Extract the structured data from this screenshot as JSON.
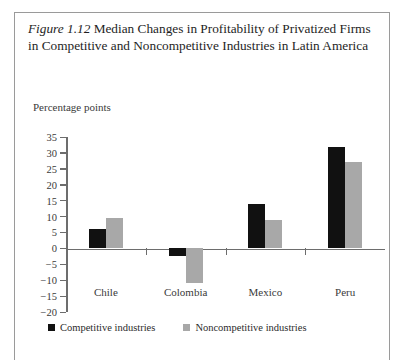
{
  "figure": {
    "label": "Figure 1.12",
    "caption": "Median Changes in Profitability of Privatized Firms in Competitive and Noncompetitive Industries in Latin America"
  },
  "axis_title": "Percentage points",
  "legend": {
    "series1_label": "Competitive industries",
    "series2_label": "Noncompetitive industries",
    "series1_color": "#111111",
    "series2_color": "#a8a8a8"
  },
  "ticks": [
    "35",
    "30",
    "25",
    "20",
    "15",
    "10",
    "5",
    "0",
    "−5",
    "−10",
    "−15",
    "−20"
  ],
  "chart_data": {
    "type": "bar",
    "title": "Figure 1.12 Median Changes in Profitability of Privatized Firms in Competitive and Noncompetitive Industries in Latin America",
    "xlabel": "",
    "ylabel": "Percentage points",
    "ylim": [
      -20,
      35
    ],
    "ytick_step": 5,
    "grid": false,
    "legend_position": "bottom-left",
    "categories": [
      "Chile",
      "Colombia",
      "Mexico",
      "Peru"
    ],
    "series": [
      {
        "name": "Competitive industries",
        "color": "#111111",
        "values": [
          6,
          -2.5,
          14,
          32
        ]
      },
      {
        "name": "Noncompetitive industries",
        "color": "#a8a8a8",
        "values": [
          9.5,
          -11,
          9,
          27
        ]
      }
    ]
  }
}
